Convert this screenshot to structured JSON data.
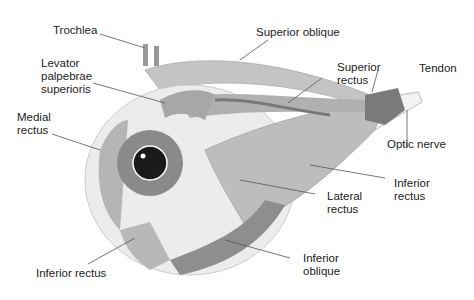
{
  "diagram": {
    "labels": {
      "trochlea": "Trochlea",
      "superior_oblique": "Superior oblique",
      "levator": "Levator\npalpebrae\nsuperioris",
      "superior_rectus": "Superior\nrectus",
      "tendon": "Tendon",
      "medial_rectus": "Medial\nrectus",
      "optic_nerve": "Optic nerve",
      "inferior_rectus_right": "Inferior\nrectus",
      "lateral_rectus": "Lateral\nrectus",
      "inferior_oblique": "Inferior\noblique",
      "inferior_rectus_bottom": "Inferior rectus"
    }
  }
}
